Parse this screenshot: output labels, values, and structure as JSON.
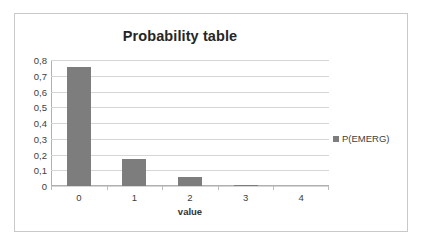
{
  "chart_data": {
    "type": "bar",
    "title": "Probability table",
    "xlabel": "value",
    "ylabel": "",
    "categories": [
      "0",
      "1",
      "2",
      "3",
      "4"
    ],
    "series": [
      {
        "name": "P(EMERG)",
        "values": [
          0.755,
          0.17,
          0.057,
          0.005,
          0
        ]
      }
    ],
    "ylim": [
      0,
      0.8
    ],
    "ytick_labels": [
      "0,8",
      "0,7",
      "0,6",
      "0,5",
      "0,4",
      "0,3",
      "0,2",
      "0,1",
      "0"
    ],
    "ytick_values": [
      0.8,
      0.7,
      0.6,
      0.5,
      0.4,
      0.3,
      0.2,
      0.1,
      0
    ],
    "grid": true,
    "legend_position": "right",
    "bar_color": "#7d7d7d",
    "gridline_color": "#d6d6d6",
    "frame_border_color": "#c9c9c9",
    "background_color": "#ffffff"
  }
}
